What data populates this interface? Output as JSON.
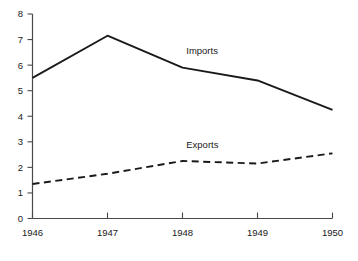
{
  "chart_data": {
    "type": "line",
    "title": "",
    "subtitle": "",
    "xlabel": "",
    "ylabel": "",
    "x": [
      1946,
      1947,
      1948,
      1949,
      1950
    ],
    "xticklabels": [
      "1946",
      "1947",
      "1948",
      "1949",
      "1950"
    ],
    "yticklabels": [
      "0",
      "1",
      "2",
      "3",
      "4",
      "5",
      "6",
      "7",
      "8"
    ],
    "yticks": [
      0,
      1,
      2,
      3,
      4,
      5,
      6,
      7,
      8
    ],
    "ylim": [
      0,
      8
    ],
    "xlim": [
      1946,
      1950
    ],
    "grid": false,
    "legend_position": "inline-annotations",
    "series": [
      {
        "name": "Imports",
        "values": [
          5.5,
          7.15,
          5.9,
          5.4,
          4.25
        ],
        "style": "solid",
        "color": "#1a1a1a",
        "label": "Imports",
        "label_x": 1948.05,
        "label_y": 6.45
      },
      {
        "name": "Exports",
        "values": [
          1.35,
          1.75,
          2.25,
          2.15,
          2.55
        ],
        "style": "dashed",
        "color": "#1a1a1a",
        "label": "Exports",
        "label_x": 1948.05,
        "label_y": 2.75
      }
    ]
  },
  "axes": {
    "y_axis_name": "y-axis",
    "x_axis_name": "x-axis"
  }
}
